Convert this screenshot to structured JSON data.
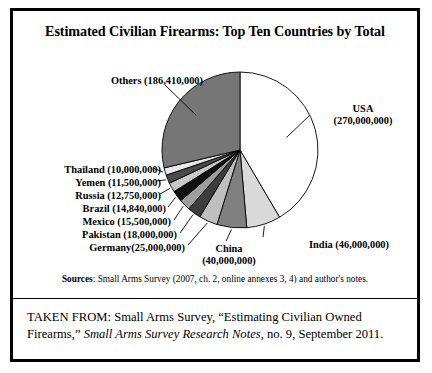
{
  "figure": {
    "title": "Estimated Civilian Firearms: Top Ten Countries by Total",
    "sources_label": "Sources",
    "sources_text": ": Small Arms Survey (2007, ch. 2, online annexes 3, 4) and author's notes.",
    "footer_part1": "TAKEN FROM: Small Arms Survey, “Estimating Civilian Owned Firearms,” ",
    "footer_italic": "Small Arms Survey Research Notes",
    "footer_part2": ", no. 9, September 2011."
  },
  "labels": {
    "usa_line1": "USA",
    "usa_line2": "(270,000,000)",
    "others": "Others (186,410,000)",
    "thailand": "Thailand (10,000,000)",
    "yemen": "Yemen (11,500,000)",
    "russia": "Russia (12,750,000)",
    "brazil": "Brazil (14,840,000)",
    "mexico": "Mexico (15,500,000)",
    "pakistan": "Pakistan (18,000,000)",
    "germany": "Germany(25,000,000)",
    "china_line1": "China",
    "china_line2": "(40,000,000)",
    "india": "India (46,000,000)"
  },
  "chart_data": {
    "type": "pie",
    "title": "Estimated Civilian Firearms: Top Ten Countries by Total",
    "unit": "firearms",
    "total": 560000000,
    "start_angle_deg": 0,
    "direction": "clockwise",
    "legend": "none-labels-with-leader-lines",
    "categories": [
      "USA",
      "India",
      "China",
      "Germany",
      "Pakistan",
      "Mexico",
      "Brazil",
      "Russia",
      "Yemen",
      "Thailand",
      "Others"
    ],
    "values": [
      270000000,
      46000000,
      40000000,
      25000000,
      18000000,
      15500000,
      14840000,
      12750000,
      11500000,
      10000000,
      186410000
    ],
    "slices": [
      {
        "name": "USA",
        "value": 270000000,
        "label": "USA (270,000,000)",
        "color": "#ffffff"
      },
      {
        "name": "India",
        "value": 46000000,
        "label": "India (46,000,000)",
        "color": "#d9d9d9"
      },
      {
        "name": "China",
        "value": 40000000,
        "label": "China (40,000,000)",
        "color": "#808080"
      },
      {
        "name": "Germany",
        "value": 25000000,
        "label": "Germany(25,000,000)",
        "color": "#bfbfbf"
      },
      {
        "name": "Pakistan",
        "value": 18000000,
        "label": "Pakistan (18,000,000)",
        "color": "#3d3d3d"
      },
      {
        "name": "Mexico",
        "value": 15500000,
        "label": "Mexico (15,500,000)",
        "color": "#9e9e9e"
      },
      {
        "name": "Brazil",
        "value": 14840000,
        "label": "Brazil (14,840,000)",
        "color": "#111111"
      },
      {
        "name": "Russia",
        "value": 12750000,
        "label": "Russia (12,750,000)",
        "color": "#c9c9c9"
      },
      {
        "name": "Yemen",
        "value": 11500000,
        "label": "Yemen (11,500,000)",
        "color": "#4a4a4a"
      },
      {
        "name": "Thailand",
        "value": 10000000,
        "label": "Thailand (10,000,000)",
        "color": "#e8e8e8"
      },
      {
        "name": "Others",
        "value": 186410000,
        "label": "Others (186,410,000)",
        "color": "#767676"
      }
    ],
    "geometry": {
      "cx": 227,
      "cy": 139,
      "r": 78
    }
  }
}
